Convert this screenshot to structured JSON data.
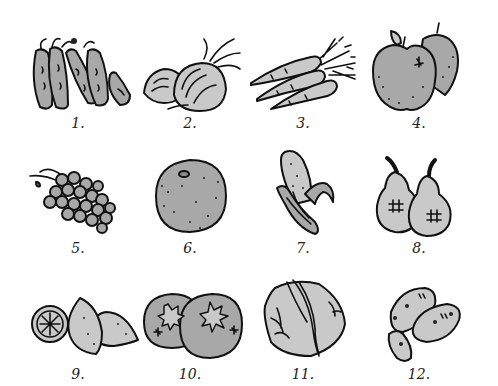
{
  "background": "#ffffff",
  "colors": {
    "outline": "#111111",
    "fill": "#a8a8a8",
    "fill_light": "#c9c9c9",
    "fill_dark": "#8a8a8a"
  },
  "items": [
    {
      "number": "1.",
      "subject": "peas-in-pods"
    },
    {
      "number": "2.",
      "subject": "onions"
    },
    {
      "number": "3.",
      "subject": "carrots"
    },
    {
      "number": "4.",
      "subject": "apples"
    },
    {
      "number": "5.",
      "subject": "grapes"
    },
    {
      "number": "6.",
      "subject": "orange"
    },
    {
      "number": "7.",
      "subject": "corn-cob"
    },
    {
      "number": "8.",
      "subject": "pears"
    },
    {
      "number": "9.",
      "subject": "lemons"
    },
    {
      "number": "10.",
      "subject": "oranges"
    },
    {
      "number": "11.",
      "subject": "cabbage"
    },
    {
      "number": "12.",
      "subject": "potatoes"
    }
  ]
}
